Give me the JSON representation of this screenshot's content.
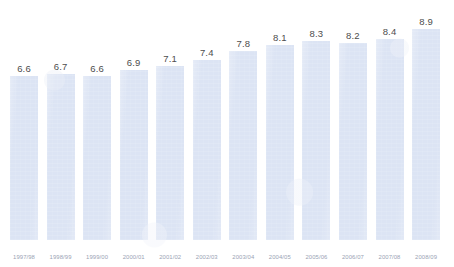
{
  "chart_data": {
    "type": "bar",
    "title": "",
    "subtitle": "",
    "xlabel": "",
    "ylabel": "",
    "grid": false,
    "legend": false,
    "axis_visible": false,
    "value_labels_shown": true,
    "ylim": [
      5.9,
      9.1
    ],
    "categories": [
      "1997/98",
      "1998/99",
      "1999/00",
      "2000/01",
      "2001/02",
      "2002/03",
      "2003/04",
      "2004/05",
      "2005/06",
      "2006/07",
      "2007/08",
      "2008/09"
    ],
    "values": [
      6.6,
      6.7,
      6.6,
      6.9,
      7.1,
      7.4,
      7.8,
      8.1,
      8.3,
      8.2,
      8.4,
      8.9
    ],
    "value_labels": [
      "6.6",
      "6.7",
      "6.6",
      "6.9",
      "7.1",
      "7.4",
      "7.8",
      "8.1",
      "8.3",
      "8.2",
      "8.4",
      "8.9"
    ],
    "colors": {
      "bar_fill": "#dce4f4",
      "background": "#ffffff",
      "value_label": "#4d4d4d",
      "tick_label": "#9aa3b4"
    }
  }
}
